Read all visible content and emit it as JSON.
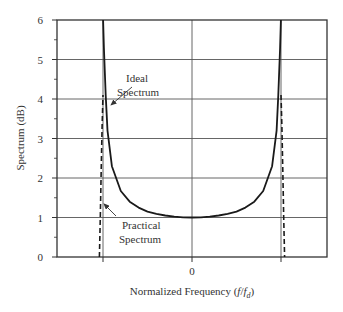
{
  "chart_data": {
    "type": "line",
    "title": "",
    "xlabel": "Normalized Frequency (f/f_d)",
    "xlabel_parts": {
      "prefix": "Normalized Frequency (",
      "f": "f",
      "slash": "/",
      "fd": "f",
      "sub": "d",
      "suffix": ")"
    },
    "ylabel": "Spectrum (dB)",
    "xlim": [
      -1.45,
      1.45
    ],
    "ylim": [
      0,
      6
    ],
    "x_ticks": [
      0
    ],
    "x_tick_labels": [
      "0"
    ],
    "y_ticks": [
      0,
      1,
      2,
      3,
      4,
      5,
      6
    ],
    "y_tick_labels": [
      "0",
      "1",
      "2",
      "3",
      "4",
      "5",
      "6"
    ],
    "grid": true,
    "series": [
      {
        "name": "Ideal Spectrum",
        "style": "solid",
        "description": "U-shaped Jakes Doppler spectrum, 1/sqrt(1-(f/fd)^2), with vertical asymptotes at f/fd = ±1",
        "x": [
          -0.999,
          -0.99,
          -0.97,
          -0.95,
          -0.9,
          -0.8,
          -0.7,
          -0.6,
          -0.5,
          -0.4,
          -0.3,
          -0.2,
          -0.1,
          0,
          0.1,
          0.2,
          0.3,
          0.4,
          0.5,
          0.6,
          0.7,
          0.8,
          0.9,
          0.95,
          0.97,
          0.99,
          0.999
        ],
        "y": [
          6.0,
          5.3,
          4.1,
          3.2,
          2.3,
          1.67,
          1.4,
          1.25,
          1.15,
          1.09,
          1.05,
          1.02,
          1.005,
          1.0,
          1.005,
          1.02,
          1.05,
          1.09,
          1.15,
          1.25,
          1.4,
          1.67,
          2.3,
          3.2,
          4.1,
          5.3,
          6.0
        ]
      },
      {
        "name": "Practical Spectrum",
        "style": "dashed",
        "description": "Finite-peak spectrum that rises steeply near ±fd and falls to 0 slightly beyond ±fd",
        "x": [
          -1.04,
          -1.03,
          -1.02,
          -1.01,
          -1.0,
          1.0,
          1.01,
          1.02,
          1.03,
          1.04
        ],
        "y": [
          0,
          1.0,
          2.2,
          3.3,
          4.1,
          4.1,
          3.3,
          2.2,
          1.0,
          0
        ]
      }
    ],
    "annotations": [
      {
        "text_lines": [
          "Ideal",
          "Spectrum"
        ],
        "points_to": "Ideal Spectrum left asymptote near y≈4.5"
      },
      {
        "text_lines": [
          "Practical",
          "Spectrum"
        ],
        "points_to": "Practical Spectrum left dashed edge near y≈1.2"
      }
    ],
    "legend": "none (inline annotations with arrows)"
  }
}
